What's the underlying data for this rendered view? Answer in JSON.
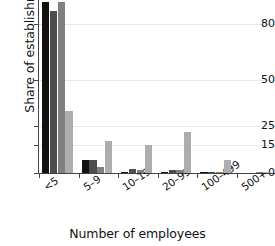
{
  "chart_data": {
    "type": "bar",
    "title": "",
    "subtitle": "",
    "xlabel": "Number of employees",
    "ylabel": "Share of establishments (%)",
    "categories": [
      "<5",
      "5–9",
      "10–19",
      "20–99",
      "100–499",
      "500+"
    ],
    "yticks": [
      0,
      15,
      25,
      50,
      80
    ],
    "ytick_labels": [
      "0",
      "15",
      "25",
      "50",
      "80"
    ],
    "ylim": [
      0,
      93
    ],
    "grid": "horizontal",
    "legend": "none",
    "series": [
      {
        "name": "series-1",
        "color": "#111111",
        "values": [
          91.5,
          7.0,
          0.7,
          0.5,
          0.05,
          0.0
        ]
      },
      {
        "name": "series-2",
        "color": "#4d4d4d",
        "values": [
          87.0,
          7.0,
          2.2,
          1.5,
          0.1,
          0.0
        ]
      },
      {
        "name": "series-3",
        "color": "#808080",
        "values": [
          91.5,
          3.3,
          1.8,
          1.5,
          0.5,
          0.2
        ]
      },
      {
        "name": "series-4",
        "color": "#adadad",
        "values": [
          33.0,
          17.0,
          15.2,
          22.0,
          7.0,
          0.6
        ]
      }
    ]
  }
}
